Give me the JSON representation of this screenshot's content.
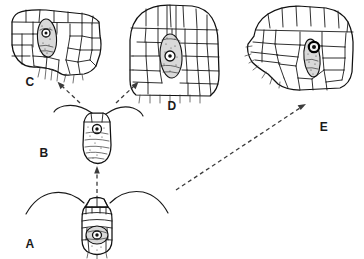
{
  "figure": {
    "background_color": "#ffffff",
    "ink_color": "#1a1a1a",
    "arrow_color": "#3b3b3b",
    "embryo_fill_color": "#d9d9d9",
    "width": 364,
    "height": 259
  },
  "panels": [
    {
      "id": "A",
      "label": "A",
      "label_x": 30,
      "label_y": 248,
      "caption": "Earliest stage: young embryo flanked by two outward-sweeping flanges",
      "stage_index": 1
    },
    {
      "id": "B",
      "label": "B",
      "label_x": 44,
      "label_y": 157,
      "caption": "Elongated embryo with two curved appendages and granular contents",
      "stage_index": 2
    },
    {
      "id": "C",
      "label": "C",
      "label_x": 30,
      "label_y": 86,
      "caption": "Embryo sunken in small cellular tissue lobe, left branch",
      "stage_index": 3
    },
    {
      "id": "D",
      "label": "D",
      "label_x": 172,
      "label_y": 110,
      "caption": "Embryo embedded in larger cellular tissue lobe, right branch",
      "stage_index": 4
    },
    {
      "id": "E",
      "label": "E",
      "label_x": 324,
      "label_y": 131,
      "caption": "Mature stage: dark ringed structure within broad cellular tissue",
      "stage_index": 5
    }
  ],
  "arrows": [
    {
      "name": "arrow-a-to-b",
      "from": "A",
      "to": "B",
      "style": "dashed",
      "direction": "up"
    },
    {
      "name": "arrow-b-to-c",
      "from": "B",
      "to": "C",
      "style": "dashed",
      "direction": "up-left"
    },
    {
      "name": "arrow-b-to-d",
      "from": "B",
      "to": "D",
      "style": "dashed",
      "direction": "up-right"
    },
    {
      "name": "arrow-b-to-e",
      "from": "B",
      "to": "E",
      "style": "dashed",
      "direction": "up-right-long"
    }
  ]
}
